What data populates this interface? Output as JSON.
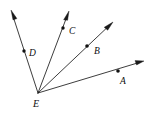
{
  "figure": {
    "name": "angle-rays-diagram",
    "type": "geometry-diagram",
    "background_color": "#ffffff",
    "stroke_color": "#1a1a1a",
    "label_color": "#0d0d0d",
    "width": 149,
    "height": 113,
    "vertex": {
      "label": "E",
      "x": 38,
      "y": 93,
      "label_x": 33,
      "label_y": 107
    },
    "rays": [
      {
        "id": "ray-ed",
        "label": "D",
        "from_label": "E",
        "to_label": "D",
        "start_x": 38,
        "start_y": 93,
        "end_x": 11,
        "end_y": 10,
        "point_x": 24,
        "point_y": 51,
        "label_x": 29,
        "label_y": 56,
        "arrow": true
      },
      {
        "id": "ray-ec",
        "label": "C",
        "from_label": "E",
        "to_label": "C",
        "start_x": 38,
        "start_y": 93,
        "end_x": 69,
        "end_y": 11,
        "point_x": 63,
        "point_y": 28,
        "label_x": 69,
        "label_y": 34,
        "arrow": true
      },
      {
        "id": "ray-eb",
        "label": "B",
        "from_label": "E",
        "to_label": "B",
        "start_x": 38,
        "start_y": 93,
        "end_x": 113,
        "end_y": 22,
        "point_x": 87,
        "point_y": 46,
        "label_x": 94,
        "label_y": 54,
        "arrow": true
      },
      {
        "id": "ray-ea",
        "label": "A",
        "from_label": "E",
        "to_label": "A",
        "start_x": 38,
        "start_y": 93,
        "end_x": 144,
        "end_y": 61,
        "point_x": 118,
        "point_y": 71,
        "label_x": 120,
        "label_y": 84,
        "arrow": true
      }
    ],
    "labels": [
      "D",
      "C",
      "B",
      "A",
      "E"
    ]
  }
}
